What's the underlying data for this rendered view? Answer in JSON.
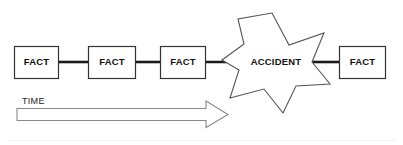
{
  "diagram": {
    "type": "flow-chain",
    "background_color": "#ffffff",
    "line_color": "#1a1a1a",
    "box_stroke_color": "#333333",
    "star_stroke_color": "#555555",
    "arrow_stroke_color": "#8a8a8a",
    "text_color": "#111111"
  },
  "nodes": [
    {
      "id": "fact-1",
      "label": "FACT",
      "shape": "rectangle",
      "order": 1
    },
    {
      "id": "fact-2",
      "label": "FACT",
      "shape": "rectangle",
      "order": 2
    },
    {
      "id": "fact-3",
      "label": "FACT",
      "shape": "rectangle",
      "order": 3
    },
    {
      "id": "accident",
      "label": "ACCIDENT",
      "shape": "star",
      "points": 7,
      "order": 4
    },
    {
      "id": "fact-4",
      "label": "FACT",
      "shape": "rectangle",
      "order": 5
    }
  ],
  "connectors": [
    {
      "from": "fact-1",
      "to": "fact-2"
    },
    {
      "from": "fact-2",
      "to": "fact-3"
    },
    {
      "from": "fact-3",
      "to": "accident"
    },
    {
      "from": "accident",
      "to": "fact-4"
    }
  ],
  "axis": {
    "label": "TIME",
    "direction": "left-to-right",
    "style": "hollow-block-arrow"
  }
}
